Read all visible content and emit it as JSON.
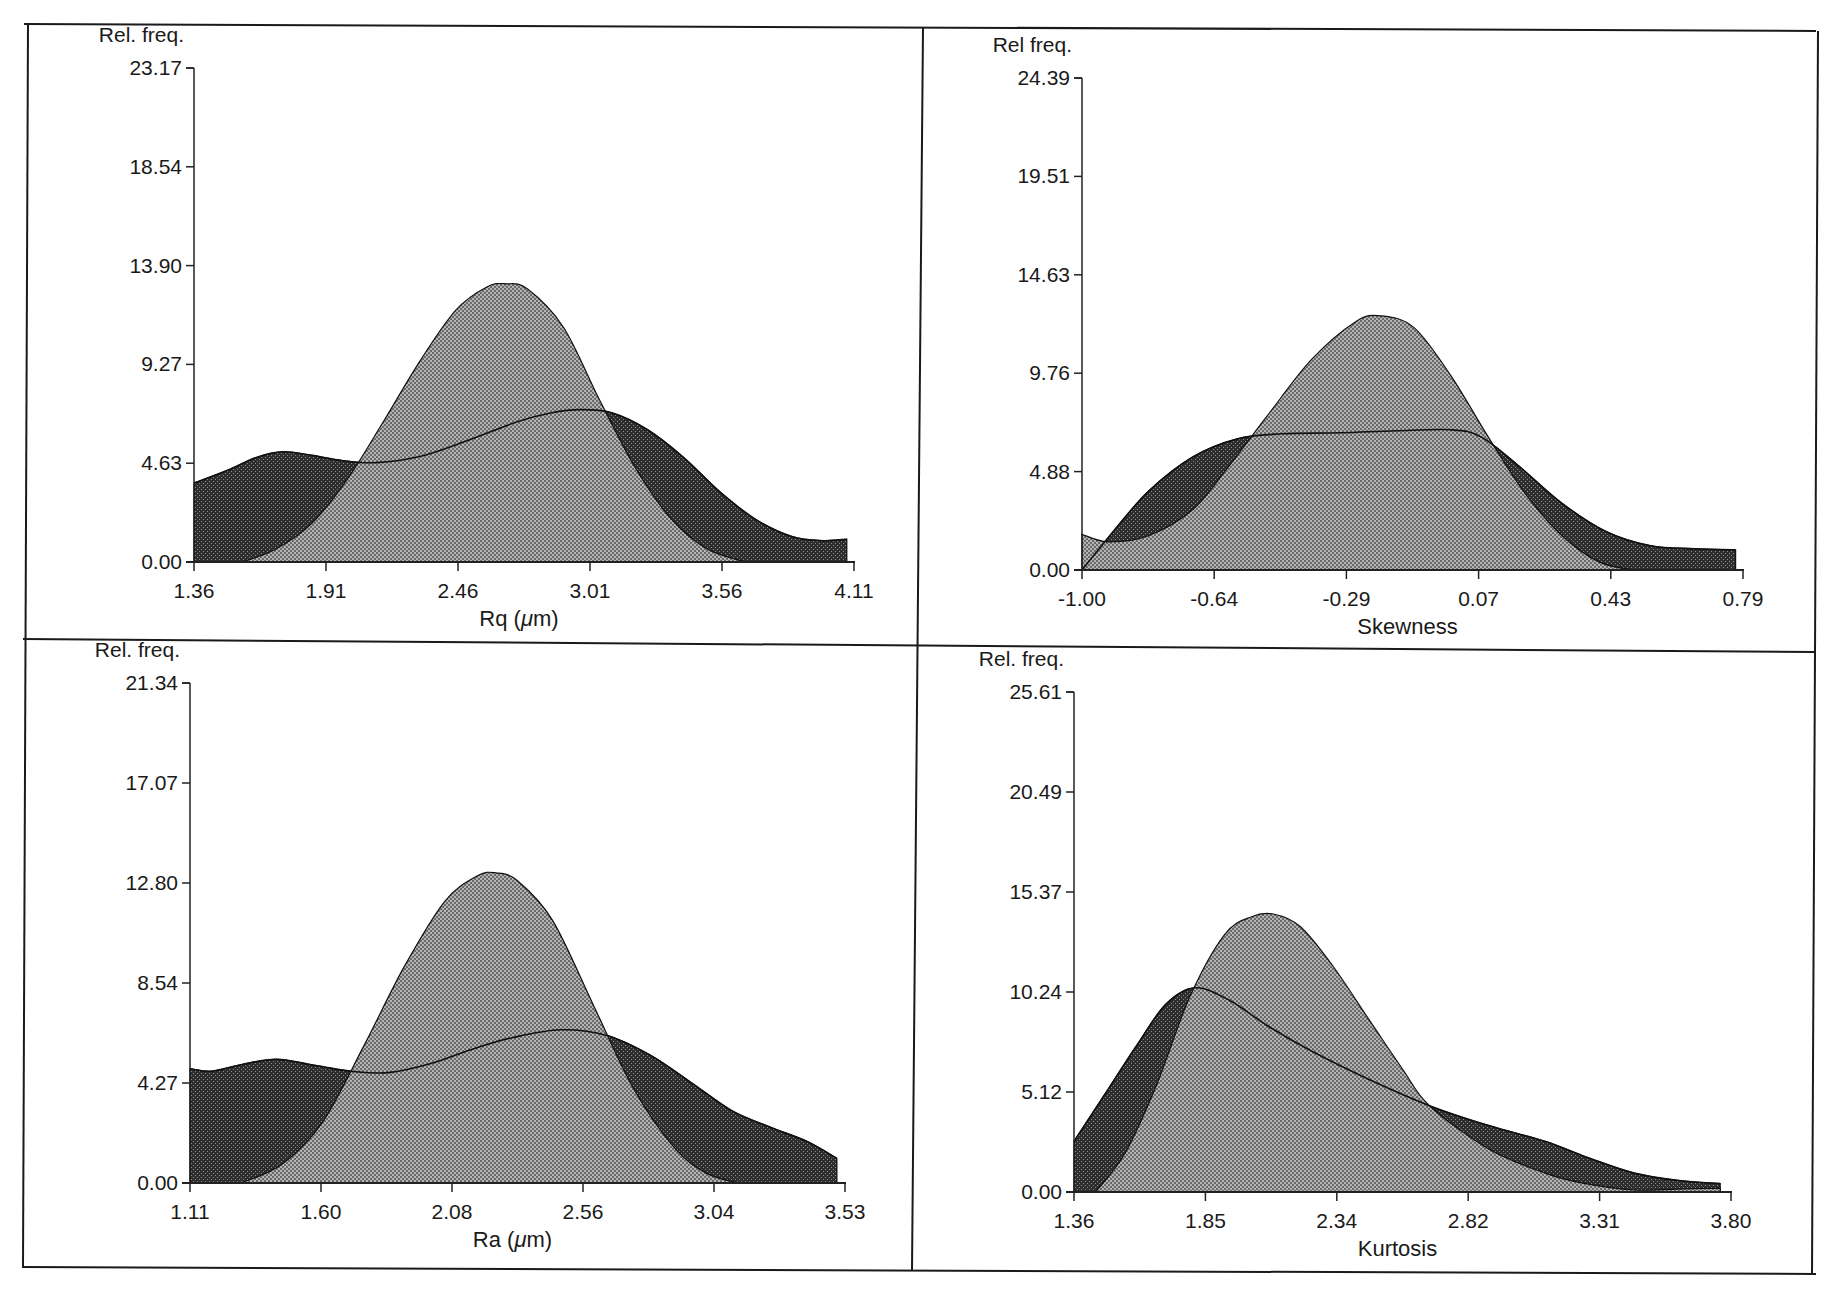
{
  "figure": {
    "width": 1825,
    "height": 1290,
    "frame": {
      "left": 24,
      "top": 24,
      "right": 1816,
      "bottom": 1272,
      "mid_x_top": 923,
      "mid_x_bottom": 914,
      "mid_y_left": 640,
      "mid_y_right": 650
    },
    "colors": {
      "frame": "#1a1a1a",
      "light_fill": "#a9a9a9",
      "light_fill_dot": "#5a5a5a",
      "dark_fill": "#3a3a3a",
      "dark_fill_dot": "#8a8a8a",
      "outline": "#111111",
      "axis": "#222222"
    }
  },
  "chart_data": [
    {
      "id": "rq",
      "type": "area",
      "title": "",
      "ylabel": "Rel. freq.",
      "xlabel": "Rq (μm)",
      "xlabel_main": "Rq",
      "xlabel_unit": "(μm)",
      "xlim": [
        1.36,
        4.11
      ],
      "ylim": [
        0.0,
        23.17
      ],
      "x_ticks": [
        "1.36",
        "1.91",
        "2.46",
        "3.01",
        "3.56",
        "4.11"
      ],
      "y_ticks": [
        "0.00",
        "4.63",
        "9.27",
        "13.90",
        "18.54",
        "23.17"
      ],
      "grid": false,
      "legend": null,
      "plot_box": {
        "x0": 194,
        "x1": 854,
        "y0": 562,
        "y1": 68
      },
      "series": [
        {
          "name": "dark (broad) distribution",
          "fill": "dark",
          "x": [
            1.36,
            1.5,
            1.62,
            1.73,
            1.85,
            1.98,
            2.12,
            2.3,
            2.5,
            2.7,
            2.85,
            2.97,
            3.1,
            3.25,
            3.4,
            3.55,
            3.7,
            3.85,
            3.98,
            4.08
          ],
          "y": [
            3.7,
            4.3,
            4.9,
            5.17,
            5.0,
            4.75,
            4.66,
            4.95,
            5.7,
            6.55,
            7.0,
            7.15,
            7.0,
            6.2,
            4.9,
            3.3,
            2.0,
            1.2,
            1.0,
            1.07
          ]
        },
        {
          "name": "light (peaked) distribution",
          "fill": "light",
          "x": [
            1.56,
            1.7,
            1.85,
            2.0,
            2.15,
            2.3,
            2.45,
            2.58,
            2.66,
            2.75,
            2.9,
            3.05,
            3.2,
            3.35,
            3.5,
            3.66
          ],
          "y": [
            0.0,
            0.6,
            1.8,
            3.9,
            6.6,
            9.4,
            11.8,
            12.9,
            13.05,
            12.8,
            11.0,
            7.6,
            4.4,
            2.0,
            0.6,
            0.0
          ]
        }
      ]
    },
    {
      "id": "skewness",
      "type": "area",
      "title": "",
      "ylabel": "Rel freq.",
      "xlabel": "Skewness",
      "xlabel_main": "Skewness",
      "xlabel_unit": "",
      "xlim": [
        -1.0,
        0.79
      ],
      "ylim": [
        0.0,
        24.39
      ],
      "x_ticks": [
        "-1.00",
        "-0.64",
        "-0.29",
        "0.07",
        "0.43",
        "0.79"
      ],
      "y_ticks": [
        "0.00",
        "4.88",
        "9.76",
        "14.63",
        "19.51",
        "24.39"
      ],
      "grid": false,
      "legend": null,
      "plot_box": {
        "x0": 1082,
        "x1": 1743,
        "y0": 570,
        "y1": 78
      },
      "series": [
        {
          "name": "dark (broad) distribution",
          "fill": "dark",
          "x": [
            -1.0,
            -0.92,
            -0.82,
            -0.7,
            -0.58,
            -0.46,
            -0.3,
            -0.15,
            0.0,
            0.08,
            0.18,
            0.3,
            0.42,
            0.54,
            0.66,
            0.77
          ],
          "y": [
            0.0,
            1.8,
            3.9,
            5.6,
            6.5,
            6.75,
            6.8,
            6.9,
            6.95,
            6.6,
            5.2,
            3.3,
            1.9,
            1.2,
            1.05,
            1.0
          ]
        },
        {
          "name": "light (peaked) distribution",
          "fill": "light",
          "x": [
            -1.0,
            -0.93,
            -0.82,
            -0.7,
            -0.6,
            -0.5,
            -0.38,
            -0.26,
            -0.19,
            -0.1,
            0.0,
            0.1,
            0.2,
            0.3,
            0.4,
            0.49
          ],
          "y": [
            1.77,
            1.4,
            1.7,
            3.0,
            5.2,
            7.6,
            10.4,
            12.3,
            12.6,
            12.0,
            9.6,
            6.6,
            3.8,
            1.7,
            0.4,
            0.0
          ]
        }
      ]
    },
    {
      "id": "ra",
      "type": "area",
      "title": "",
      "ylabel": "Rel. freq.",
      "xlabel": "Ra (μm)",
      "xlabel_main": "Ra",
      "xlabel_unit": "(μm)",
      "xlim": [
        1.11,
        3.53
      ],
      "ylim": [
        0.0,
        21.34
      ],
      "x_ticks": [
        "1.11",
        "1.60",
        "2.08",
        "2.56",
        "3.04",
        "3.53"
      ],
      "y_ticks": [
        "0.00",
        "4.27",
        "8.54",
        "12.80",
        "17.07",
        "21.34"
      ],
      "grid": false,
      "legend": null,
      "plot_box": {
        "x0": 190,
        "x1": 845,
        "y0": 1183,
        "y1": 683
      },
      "series": [
        {
          "name": "dark (broad) distribution",
          "fill": "dark",
          "x": [
            1.11,
            1.19,
            1.3,
            1.43,
            1.58,
            1.72,
            1.85,
            2.0,
            2.15,
            2.3,
            2.48,
            2.65,
            2.81,
            2.96,
            3.11,
            3.25,
            3.39,
            3.5
          ],
          "y": [
            4.88,
            4.77,
            5.05,
            5.28,
            5.0,
            4.75,
            4.72,
            5.1,
            5.7,
            6.2,
            6.54,
            6.3,
            5.46,
            4.3,
            3.1,
            2.4,
            1.77,
            1.05
          ]
        },
        {
          "name": "light (peaked) distribution",
          "fill": "light",
          "x": [
            1.3,
            1.45,
            1.6,
            1.75,
            1.9,
            2.05,
            2.17,
            2.24,
            2.32,
            2.45,
            2.6,
            2.75,
            2.9,
            3.02,
            3.14
          ],
          "y": [
            0.0,
            0.8,
            2.6,
            5.8,
            9.2,
            12.0,
            13.1,
            13.24,
            12.9,
            11.2,
            7.6,
            4.0,
            1.5,
            0.4,
            0.0
          ]
        }
      ]
    },
    {
      "id": "kurtosis",
      "type": "area",
      "title": "",
      "ylabel": "Rel. freq.",
      "xlabel": "Kurtosis",
      "xlabel_main": "Kurtosis",
      "xlabel_unit": "",
      "xlim": [
        1.36,
        3.8
      ],
      "ylim": [
        0.0,
        25.61
      ],
      "x_ticks": [
        "1.36",
        "1.85",
        "2.34",
        "2.82",
        "3.31",
        "3.80"
      ],
      "y_ticks": [
        "0.00",
        "5.12",
        "10.24",
        "15.37",
        "20.49",
        "25.61"
      ],
      "grid": false,
      "legend": null,
      "plot_box": {
        "x0": 1074,
        "x1": 1731,
        "y0": 1192,
        "y1": 692
      },
      "series": [
        {
          "name": "dark (broad) distribution",
          "fill": "dark",
          "x": [
            1.36,
            1.47,
            1.59,
            1.7,
            1.81,
            1.94,
            2.08,
            2.24,
            2.45,
            2.68,
            2.9,
            3.11,
            3.28,
            3.44,
            3.6,
            3.76
          ],
          "y": [
            2.59,
            4.9,
            7.44,
            9.6,
            10.46,
            9.8,
            8.5,
            7.23,
            5.8,
            4.42,
            3.4,
            2.59,
            1.7,
            0.97,
            0.6,
            0.43
          ]
        },
        {
          "name": "light (peaked) distribution",
          "fill": "light",
          "x": [
            1.44,
            1.55,
            1.67,
            1.79,
            1.92,
            2.02,
            2.1,
            2.2,
            2.32,
            2.46,
            2.58,
            2.68,
            2.9,
            3.11,
            3.25,
            3.44,
            3.6,
            3.76
          ],
          "y": [
            0.0,
            2.0,
            5.6,
            10.0,
            13.2,
            14.1,
            14.24,
            13.6,
            11.6,
            8.74,
            6.3,
            4.42,
            2.2,
            0.97,
            0.45,
            0.1,
            0.15,
            0.2
          ]
        }
      ]
    }
  ]
}
